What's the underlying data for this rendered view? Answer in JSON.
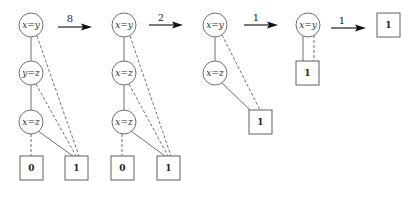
{
  "diagram": {
    "stages": [
      {
        "nodes": [
          "x=y",
          "y=z",
          "x=z"
        ],
        "terminals": [
          "0",
          "1"
        ]
      },
      {
        "nodes": [
          "x=y",
          "x=z",
          "x=z"
        ],
        "terminals": [
          "0",
          "1"
        ]
      },
      {
        "nodes": [
          "x=y",
          "x=z"
        ],
        "terminals": [
          "1"
        ]
      },
      {
        "nodes": [
          "x=y"
        ],
        "terminals": [
          "1"
        ]
      },
      {
        "nodes": [],
        "terminals": [
          "1"
        ]
      }
    ],
    "arrows": [
      {
        "label": "8"
      },
      {
        "label": "2"
      },
      {
        "label": "1"
      },
      {
        "label": "1"
      }
    ]
  }
}
